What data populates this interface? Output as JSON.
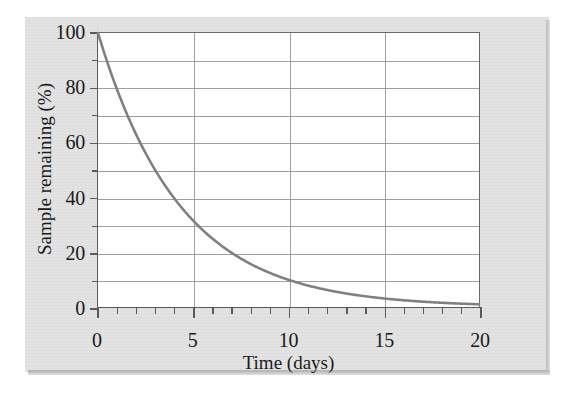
{
  "figure": {
    "background_color": "#e3e3e3",
    "plot_background_color": "#ffffff",
    "axis_color": "#5a5a5a",
    "grid_color": "#9a9a9a",
    "curve_color": "#808080"
  },
  "chart_data": {
    "type": "line",
    "title": "",
    "subtitle": "",
    "xlabel": "Time (days)",
    "ylabel": "Sample remaining (%)",
    "xlim": [
      0,
      20
    ],
    "ylim": [
      0,
      100
    ],
    "grid": true,
    "legend": null,
    "x_major_ticks": [
      0,
      5,
      10,
      15,
      20
    ],
    "x_major_tick_labels": [
      "0",
      "5",
      "10",
      "15",
      "20"
    ],
    "x_minor_tick_step": 1,
    "y_major_ticks": [
      0,
      20,
      40,
      60,
      80,
      100
    ],
    "y_major_tick_labels": [
      "0",
      "20",
      "40",
      "60",
      "80",
      "100"
    ],
    "y_gridline_step": 10,
    "series": [
      {
        "name": "Radioactive decay",
        "model": "100 * exp(-0.2310 * t)",
        "half_life_days": 3,
        "x": [
          0,
          1,
          2,
          3,
          4,
          5,
          6,
          7,
          8,
          9,
          10,
          11,
          12,
          13,
          14,
          15,
          16,
          17,
          18,
          19,
          20
        ],
        "values": [
          100,
          79.4,
          63.0,
          50.0,
          39.7,
          31.5,
          25.0,
          19.8,
          15.7,
          12.5,
          9.9,
          7.9,
          6.2,
          5.0,
          3.9,
          3.1,
          2.5,
          2.0,
          1.6,
          1.2,
          1.0
        ]
      }
    ]
  }
}
